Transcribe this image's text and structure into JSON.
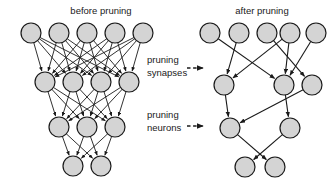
{
  "figure": {
    "type": "diagram",
    "background_color": "#ffffff",
    "node_fill_color": "#d4d4d4",
    "node_stroke_color": "#1a1a1a",
    "edge_color": "#1a1a1a",
    "text_color": "#1a1a1a",
    "width": 335,
    "height": 186
  },
  "titles": {
    "left": "before pruning",
    "right": "after pruning"
  },
  "stage_labels": [
    {
      "line1": "pruning",
      "line2": "synapses",
      "arrow": "dashed-arrow-right-icon"
    },
    {
      "line1": "pruning",
      "line2": "neurons",
      "arrow": "dashed-arrow-right-icon"
    }
  ],
  "networks": {
    "before": {
      "name": "before-pruning-network",
      "layer_sizes": [
        5,
        4,
        3,
        2
      ],
      "fully_connected": true,
      "node_radius": 10,
      "layers": [
        {
          "y": 33,
          "nodes": [
            {
              "x": 31
            },
            {
              "x": 59
            },
            {
              "x": 87
            },
            {
              "x": 115
            },
            {
              "x": 143
            }
          ]
        },
        {
          "y": 82,
          "nodes": [
            {
              "x": 45
            },
            {
              "x": 73
            },
            {
              "x": 101
            },
            {
              "x": 129
            }
          ]
        },
        {
          "y": 127,
          "nodes": [
            {
              "x": 59
            },
            {
              "x": 87
            },
            {
              "x": 115
            }
          ]
        },
        {
          "y": 166,
          "nodes": [
            {
              "x": 73
            },
            {
              "x": 101
            }
          ]
        }
      ]
    },
    "after": {
      "name": "after-pruning-network",
      "layer_sizes": [
        5,
        3,
        2,
        2
      ],
      "fully_connected": false,
      "node_radius": 10,
      "layers": [
        {
          "y": 33,
          "nodes": [
            {
              "x": 210
            },
            {
              "x": 239
            },
            {
              "x": 267
            },
            {
              "x": 290
            },
            {
              "x": 316
            }
          ]
        },
        {
          "y": 85,
          "nodes": [
            {
              "x": 224
            },
            {
              "x": 284
            },
            {
              "x": 312
            }
          ]
        },
        {
          "y": 128,
          "nodes": [
            {
              "x": 230
            },
            {
              "x": 290
            }
          ]
        },
        {
          "y": 167,
          "nodes": [
            {
              "x": 245
            },
            {
              "x": 275
            }
          ]
        }
      ],
      "edges": [
        {
          "from": [
            0,
            0
          ],
          "to": [
            1,
            1
          ]
        },
        {
          "from": [
            0,
            1
          ],
          "to": [
            1,
            0
          ]
        },
        {
          "from": [
            0,
            2
          ],
          "to": [
            1,
            2
          ]
        },
        {
          "from": [
            0,
            3
          ],
          "to": [
            1,
            0
          ]
        },
        {
          "from": [
            0,
            3
          ],
          "to": [
            1,
            1
          ]
        },
        {
          "from": [
            0,
            4
          ],
          "to": [
            1,
            1
          ]
        },
        {
          "from": [
            1,
            0
          ],
          "to": [
            2,
            0
          ]
        },
        {
          "from": [
            1,
            1
          ],
          "to": [
            2,
            1
          ]
        },
        {
          "from": [
            1,
            2
          ],
          "to": [
            2,
            0
          ]
        },
        {
          "from": [
            2,
            0
          ],
          "to": [
            3,
            1
          ]
        },
        {
          "from": [
            2,
            1
          ],
          "to": [
            3,
            0
          ]
        }
      ]
    }
  }
}
